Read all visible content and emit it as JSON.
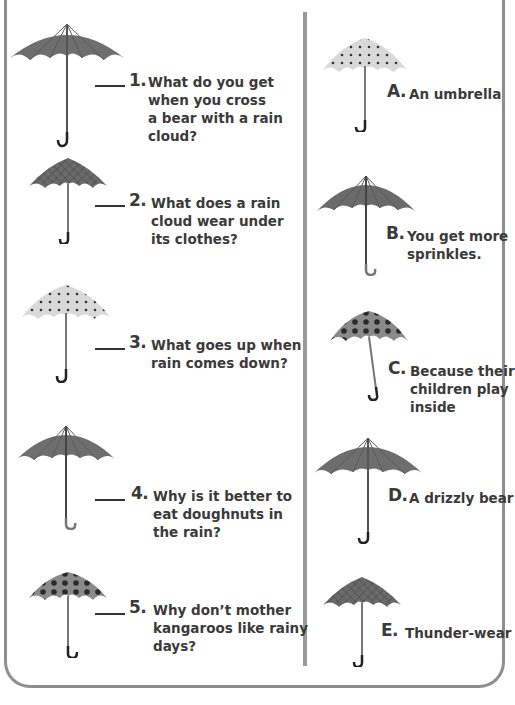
{
  "questions": [
    {
      "number": "1.",
      "text_lines": [
        "What do you get",
        "when you cross",
        "a bear with a rain",
        "cloud?"
      ],
      "umbrella_style": "solid-dark"
    },
    {
      "number": "2.",
      "text_lines": [
        "What does a rain",
        "cloud wear under",
        "its clothes?"
      ],
      "umbrella_style": "plaid"
    },
    {
      "number": "3.",
      "text_lines": [
        "What goes up when",
        "rain comes down?"
      ],
      "umbrella_style": "light-polka-dot"
    },
    {
      "number": "4.",
      "text_lines": [
        "Why is it better to",
        "eat doughnuts in",
        "the rain?"
      ],
      "umbrella_style": "solid-dark"
    },
    {
      "number": "5.",
      "text_lines": [
        "Why don’t mother",
        "kangaroos like rainy",
        "days?"
      ],
      "umbrella_style": "big-polka-dot"
    }
  ],
  "answers": [
    {
      "letter": "A.",
      "text_lines": [
        "An umbrella"
      ],
      "umbrella_style": "light-polka-dot"
    },
    {
      "letter": "B.",
      "text_lines": [
        "You get more",
        "sprinkles."
      ],
      "umbrella_style": "solid-dark"
    },
    {
      "letter": "C.",
      "text_lines": [
        "Because their",
        "children play",
        "inside"
      ],
      "umbrella_style": "big-polka-dot"
    },
    {
      "letter": "D.",
      "text_lines": [
        "A drizzly bear"
      ],
      "umbrella_style": "solid-dark"
    },
    {
      "letter": "E.",
      "text_lines": [
        "Thunder-wear"
      ],
      "umbrella_style": "plaid"
    }
  ],
  "colors": {
    "border": "#8f8f8f",
    "divider": "#9a9a9a",
    "text": "#3a3a3a",
    "umbrella_dark": "#6e6e6e",
    "umbrella_light": "#d8d8d8"
  }
}
